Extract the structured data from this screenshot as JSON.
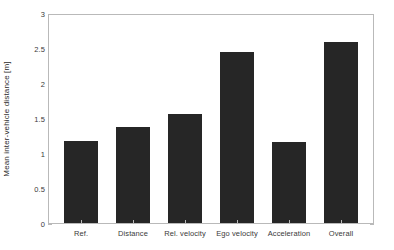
{
  "chart_data": {
    "type": "bar",
    "title": "",
    "xlabel": "",
    "ylabel": "Mean inter-vehicle distance [m]",
    "categories": [
      "Ref.",
      "Distance",
      "Rel. velocity",
      "Ego velocity",
      "Acceleration",
      "Overall"
    ],
    "values": [
      1.17,
      1.37,
      1.56,
      2.44,
      1.16,
      2.59
    ],
    "ylim": [
      0,
      3
    ],
    "yticks": [
      0,
      0.5,
      1,
      1.5,
      2,
      2.5,
      3
    ],
    "ytick_labels": [
      "0",
      "0.5",
      "1",
      "1.5",
      "2",
      "2.5",
      "3"
    ],
    "grid": false,
    "legend": null,
    "bar_color": "#262626",
    "axis_color": "#b9b9b9",
    "background_color": "#ffffff"
  }
}
